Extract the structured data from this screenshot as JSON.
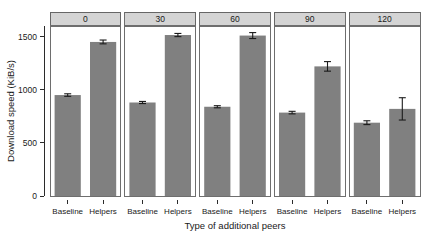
{
  "chart_data": {
    "type": "bar",
    "title": "",
    "xlabel": "Type of additional peers",
    "ylabel": "Download speed (KiB/s)",
    "ylim": [
      0,
      1600
    ],
    "yticks": [
      0,
      500,
      1000,
      1500
    ],
    "ytick_labels": [
      "0",
      "500",
      "1000",
      "1500"
    ],
    "grid": false,
    "legend": "none",
    "facet_variable": "number of additional peers",
    "facet_labels": [
      "0",
      "30",
      "60",
      "90",
      "120"
    ],
    "categories": [
      "Baseline",
      "Helpers"
    ],
    "bar_color": "#808080",
    "panels": [
      {
        "label": "0",
        "bars": [
          {
            "category": "Baseline",
            "value": 950,
            "error": 12
          },
          {
            "category": "Helpers",
            "value": 1450,
            "error": 18
          }
        ]
      },
      {
        "label": "30",
        "bars": [
          {
            "category": "Baseline",
            "value": 880,
            "error": 10
          },
          {
            "category": "Helpers",
            "value": 1515,
            "error": 15
          }
        ]
      },
      {
        "label": "60",
        "bars": [
          {
            "category": "Baseline",
            "value": 840,
            "error": 10
          },
          {
            "category": "Helpers",
            "value": 1510,
            "error": 28
          }
        ]
      },
      {
        "label": "90",
        "bars": [
          {
            "category": "Baseline",
            "value": 785,
            "error": 12
          },
          {
            "category": "Helpers",
            "value": 1220,
            "error": 45
          }
        ]
      },
      {
        "label": "120",
        "bars": [
          {
            "category": "Baseline",
            "value": 690,
            "error": 18
          },
          {
            "category": "Helpers",
            "value": 820,
            "error": 105
          }
        ]
      }
    ]
  }
}
